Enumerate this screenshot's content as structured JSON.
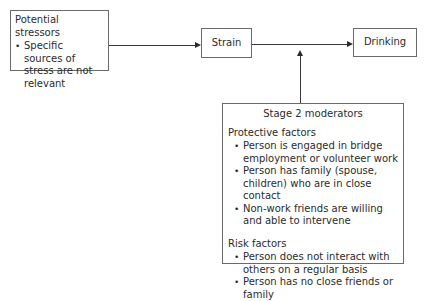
{
  "diagram": {
    "stressors": {
      "title": "Potential stressors",
      "bullets": [
        "Specific sources of stress are not relevant"
      ]
    },
    "strain": {
      "label": "Strain"
    },
    "drinking": {
      "label": "Drinking"
    },
    "moderators": {
      "title": "Stage 2 moderators",
      "protective": {
        "heading": "Protective factors",
        "items": [
          "Person is engaged in bridge employment or volunteer work",
          "Person has family (spouse, children) who are in close contact",
          "Non-work friends are willing and able to intervene"
        ]
      },
      "risk": {
        "heading": "Risk factors",
        "items": [
          "Person does not interact with others on a regular basis",
          "Person has no close friends or family"
        ]
      }
    },
    "edges": [
      {
        "from": "Potential stressors",
        "to": "Strain"
      },
      {
        "from": "Strain",
        "to": "Drinking"
      },
      {
        "from": "Stage 2 moderators",
        "to": "Strain-Drinking link"
      }
    ]
  }
}
